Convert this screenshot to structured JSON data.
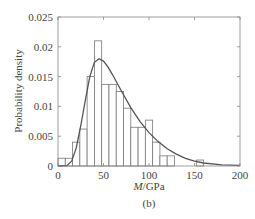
{
  "chart_data": {
    "type": "bar",
    "subtype": "histogram_with_fitted_curve",
    "title": "",
    "caption": "(b)",
    "xlabel_italic": "M",
    "xlabel_unit": "/GPa",
    "ylabel": "Probability density",
    "xlim": [
      0,
      200
    ],
    "ylim": [
      0,
      0.025
    ],
    "xticks": [
      "0",
      "50",
      "100",
      "150",
      "200"
    ],
    "yticks": [
      "0",
      "0.005",
      "0.01",
      "0.015",
      "0.02",
      "0.025"
    ],
    "grid": false,
    "legend": null,
    "bin_width": 8,
    "bins": [
      {
        "x0": 0,
        "x1": 8,
        "value": 0.0013
      },
      {
        "x0": 8,
        "x1": 16,
        "value": 0.0013
      },
      {
        "x0": 16,
        "x1": 24,
        "value": 0.004
      },
      {
        "x0": 24,
        "x1": 32,
        "value": 0.0062
      },
      {
        "x0": 32,
        "x1": 40,
        "value": 0.015
      },
      {
        "x0": 40,
        "x1": 48,
        "value": 0.021
      },
      {
        "x0": 48,
        "x1": 56,
        "value": 0.0137
      },
      {
        "x0": 56,
        "x1": 64,
        "value": 0.0137
      },
      {
        "x0": 64,
        "x1": 72,
        "value": 0.0125
      },
      {
        "x0": 72,
        "x1": 80,
        "value": 0.0097
      },
      {
        "x0": 80,
        "x1": 88,
        "value": 0.0065
      },
      {
        "x0": 88,
        "x1": 96,
        "value": 0.0065
      },
      {
        "x0": 96,
        "x1": 104,
        "value": 0.0077
      },
      {
        "x0": 104,
        "x1": 112,
        "value": 0.004
      },
      {
        "x0": 112,
        "x1": 120,
        "value": 0.0017
      },
      {
        "x0": 120,
        "x1": 128,
        "value": 0.0017
      },
      {
        "x0": 152,
        "x1": 160,
        "value": 0.001
      }
    ],
    "series": [
      {
        "name": "fitted density",
        "type": "line",
        "x": [
          0,
          10,
          15,
          20,
          25,
          30,
          35,
          40,
          45,
          50,
          55,
          60,
          65,
          70,
          80,
          90,
          100,
          110,
          120,
          130,
          140,
          150,
          160,
          180,
          200
        ],
        "values": [
          0.0,
          0.0001,
          0.0008,
          0.003,
          0.0068,
          0.011,
          0.015,
          0.0174,
          0.018,
          0.0176,
          0.0166,
          0.0153,
          0.0139,
          0.0125,
          0.0098,
          0.0075,
          0.0056,
          0.0041,
          0.0029,
          0.002,
          0.0013,
          0.0008,
          0.0005,
          0.0002,
          0.0001
        ]
      }
    ],
    "colors": {
      "bars_edge": "#777777",
      "bars_fill": "#ffffff",
      "curve": "#555555",
      "axes": "#777777"
    }
  }
}
